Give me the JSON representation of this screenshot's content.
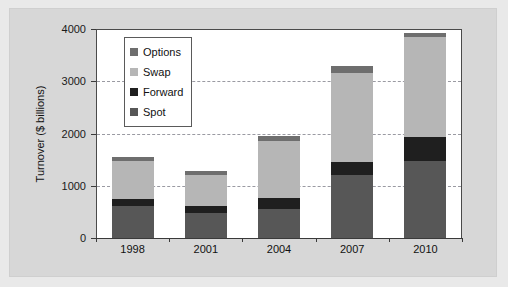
{
  "chart_data": {
    "type": "bar",
    "title": "",
    "subtitle": "",
    "xlabel": "",
    "ylabel": "Turnover ($ billions)",
    "categories": [
      "1998",
      "2001",
      "2004",
      "2007",
      "2010"
    ],
    "ylim": [
      0,
      4000
    ],
    "yticks": [
      "0",
      "1000",
      "2000",
      "3000",
      "4000"
    ],
    "ytick_values": [
      0,
      1000,
      2000,
      3000,
      4000
    ],
    "grid": true,
    "stacked": true,
    "legend_position": "top-left inside plot",
    "series": [
      {
        "name": "Spot",
        "color": "#575757",
        "values": [
          620,
          480,
          560,
          1200,
          1480
        ]
      },
      {
        "name": "Forward",
        "color": "#1f1f1f",
        "values": [
          130,
          130,
          210,
          250,
          460
        ]
      },
      {
        "name": "Swap",
        "color": "#b6b6b6",
        "values": [
          730,
          590,
          1090,
          1700,
          1900
        ]
      },
      {
        "name": "Options",
        "color": "#6e6e6e",
        "values": [
          80,
          90,
          90,
          150,
          80
        ]
      }
    ],
    "totals": [
      1560,
      1290,
      1950,
      3300,
      3920
    ],
    "stack_order_bottom_to_top": [
      "Spot",
      "Forward",
      "Swap",
      "Options"
    ]
  },
  "legend": {
    "items": [
      {
        "label": "Options",
        "color": "#6e6e6e"
      },
      {
        "label": "Swap",
        "color": "#b6b6b6"
      },
      {
        "label": "Forward",
        "color": "#1f1f1f"
      },
      {
        "label": "Spot",
        "color": "#575757"
      }
    ]
  },
  "colors": {
    "figure_background": "#e9e9e9",
    "frame_background": "#d7d7d7",
    "plot_background": "#ffffff",
    "axis": "#3a3a3a",
    "gridline": "#9a9aa2",
    "text": "#111111"
  }
}
